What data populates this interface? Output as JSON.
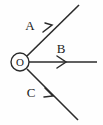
{
  "figure": {
    "background_color": "#fefefe",
    "stroke_color": "#2b2b2b",
    "width": 103,
    "height": 125
  },
  "origin": {
    "label": "O",
    "marker": "circled-origin",
    "x": 20,
    "y": 62,
    "radius": 9
  },
  "vectors": [
    {
      "label": "A",
      "direction": "up-right",
      "label_x": 30,
      "label_y": 30,
      "start_x": 27,
      "start_y": 56,
      "end_x": 79,
      "end_y": 5,
      "arrow_x": 50,
      "arrow_y": 28
    },
    {
      "label": "B",
      "direction": "right",
      "label_x": 57,
      "label_y": 53,
      "start_x": 29,
      "start_y": 62,
      "end_x": 97,
      "end_y": 62,
      "arrow_x": 64,
      "arrow_y": 62
    },
    {
      "label": "C",
      "direction": "down-right",
      "label_x": 30,
      "label_y": 97,
      "start_x": 27,
      "start_y": 69,
      "end_x": 78,
      "end_y": 120,
      "arrow_x": 51,
      "arrow_y": 94
    }
  ]
}
